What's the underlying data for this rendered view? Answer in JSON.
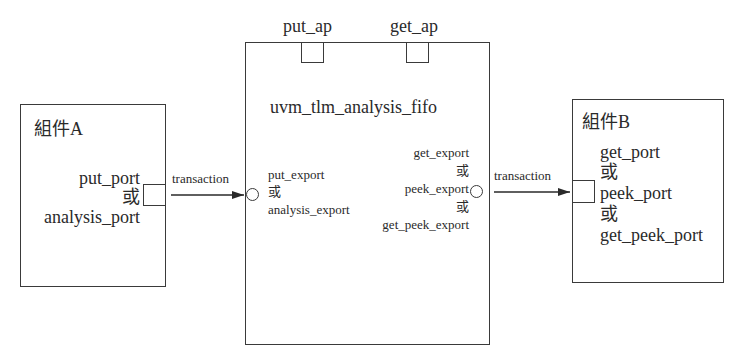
{
  "component_a": {
    "title": "組件A",
    "port_lines": [
      "put_port",
      "或",
      "analysis_port"
    ]
  },
  "fifo": {
    "title": "uvm_tlm_analysis_fifo",
    "top_ports": [
      "put_ap",
      "get_ap"
    ],
    "left_exports": [
      "put_export",
      "或",
      "analysis_export"
    ],
    "right_exports": [
      "get_export",
      "或",
      "peek_export",
      "或",
      "get_peek_export"
    ]
  },
  "component_b": {
    "title": "組件B",
    "port_lines": [
      "get_port",
      "或",
      "peek_port",
      "或",
      "get_peek_port"
    ]
  },
  "connections": [
    {
      "from": "component_a",
      "to": "fifo",
      "label": "transaction"
    },
    {
      "from": "fifo",
      "to": "component_b",
      "label": "transaction"
    }
  ],
  "colors": {
    "stroke": "#3a3a3a",
    "text": "#2a2a2a",
    "background": "#ffffff"
  }
}
